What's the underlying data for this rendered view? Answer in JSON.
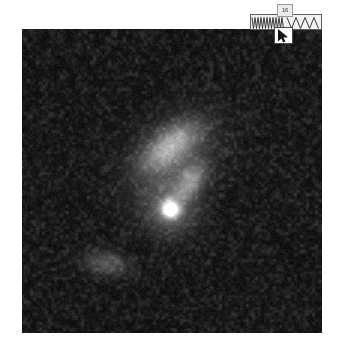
{
  "viewer": {
    "title": "Astronomical Image Viewer",
    "background_color": "#ffffff"
  },
  "image": {
    "name": "sky-field",
    "description": "Grayscale astronomical CCD field with noisy dark background",
    "x": 22,
    "y": 29,
    "width": 300,
    "height": 304,
    "background_color": "#090909",
    "noise": {
      "base_level": 14,
      "amplitude": 46,
      "cell_size": 3,
      "seed": 20240517
    },
    "objects": [
      {
        "name": "elongated-galaxy",
        "type": "diffuse-extended",
        "cx": 148,
        "cy": 117,
        "rx": 34,
        "ry": 17,
        "angle_deg": -38,
        "peak": 118
      },
      {
        "name": "galaxy-tail",
        "type": "diffuse-extended",
        "cx": 168,
        "cy": 152,
        "rx": 22,
        "ry": 13,
        "angle_deg": -55,
        "peak": 96
      },
      {
        "name": "galaxy-halo",
        "type": "diffuse-extended",
        "cx": 152,
        "cy": 128,
        "rx": 54,
        "ry": 38,
        "angle_deg": -40,
        "peak": 48
      },
      {
        "name": "bright-point-source",
        "type": "point-source",
        "cx": 148,
        "cy": 180,
        "radius": 9,
        "halo_radius": 26,
        "peak": 255
      },
      {
        "name": "faint-companion-blob",
        "type": "diffuse-extended",
        "cx": 84,
        "cy": 234,
        "rx": 24,
        "ry": 12,
        "angle_deg": 8,
        "peak": 64
      }
    ]
  },
  "overlay": {
    "waveform": {
      "name": "waveform-bar",
      "x": 250,
      "y": 14,
      "width": 72,
      "height": 16,
      "fill_color": "#f2f2f2",
      "stroke_color": "#3a3a3a",
      "border_color": "#5d5d5d",
      "segments": [
        {
          "name": "high-frequency-zigzag",
          "start": 1,
          "end": 33,
          "period": 3,
          "amplitude": 11
        },
        {
          "name": "low-frequency-triangles",
          "start": 36,
          "end": 71,
          "period": 9,
          "amplitude": 11
        }
      ]
    },
    "tooltip": {
      "name": "value-tooltip",
      "label": "16",
      "x": 277,
      "y": 4,
      "background_color": "#ececed",
      "border_color": "#9a9a9a"
    },
    "cursor": {
      "name": "mouse-cursor",
      "glyph": "arrow-pointer",
      "x": 274,
      "y": 27,
      "color": "#111111",
      "background_color": "#fdfdfd"
    }
  }
}
